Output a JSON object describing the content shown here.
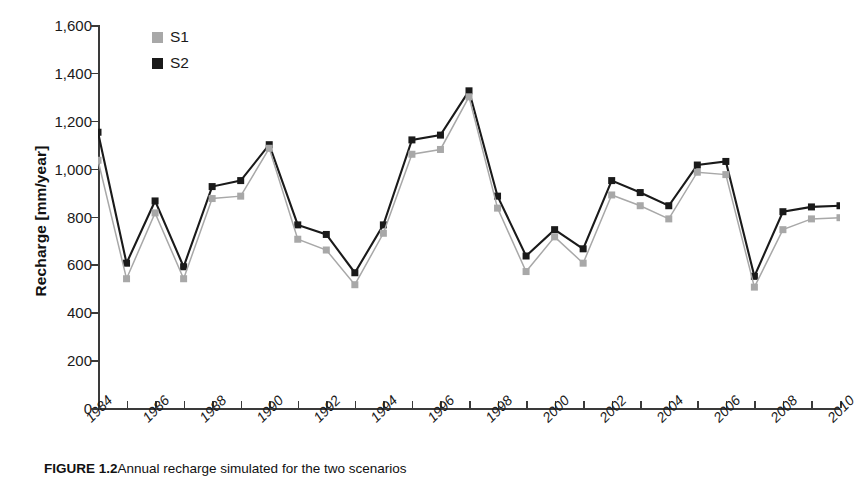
{
  "chart_data": {
    "type": "line",
    "title": "",
    "xlabel": "",
    "ylabel": "Recharge [mm/year]",
    "x": [
      1984,
      1985,
      1986,
      1987,
      1988,
      1989,
      1990,
      1991,
      1992,
      1993,
      1994,
      1995,
      1996,
      1997,
      1998,
      1999,
      2000,
      2001,
      2002,
      2003,
      2004,
      2005,
      2006,
      2007,
      2008,
      2009,
      2010
    ],
    "xlim": [
      1984,
      2010
    ],
    "ylim": [
      0,
      1600
    ],
    "yticks": [
      0,
      200,
      400,
      600,
      800,
      1000,
      1200,
      1400,
      1600
    ],
    "ytick_labels": [
      "0",
      "200",
      "400",
      "600",
      "800",
      "1,000",
      "1,200",
      "1,400",
      "1,600"
    ],
    "xtick_labels": [
      "1984",
      "1986",
      "1988",
      "1990",
      "1992",
      "1994",
      "1996",
      "1998",
      "2000",
      "2002",
      "2004",
      "2006",
      "2008",
      "2010"
    ],
    "xtick_every": 2,
    "grid": false,
    "legend_position": "top-left",
    "series": [
      {
        "name": "S1",
        "color": "#a8a8a8",
        "marker": "square",
        "values": [
          1035,
          540,
          815,
          540,
          875,
          885,
          1085,
          705,
          660,
          515,
          730,
          1060,
          1080,
          1300,
          835,
          570,
          715,
          605,
          890,
          845,
          790,
          985,
          975,
          505,
          745,
          790,
          795
        ]
      },
      {
        "name": "S2",
        "color": "#1a1a1a",
        "marker": "square",
        "values": [
          1152,
          605,
          865,
          590,
          925,
          950,
          1100,
          765,
          725,
          565,
          765,
          1120,
          1140,
          1325,
          885,
          635,
          745,
          665,
          950,
          900,
          845,
          1015,
          1030,
          550,
          820,
          840,
          845
        ]
      }
    ]
  },
  "legend": {
    "items": [
      {
        "label": "S1",
        "color": "#a8a8a8"
      },
      {
        "label": "S2",
        "color": "#1a1a1a"
      }
    ]
  },
  "caption": {
    "figure_number": "FIGURE 1.2",
    "text": "Annual recharge simulated for the two scenarios"
  }
}
